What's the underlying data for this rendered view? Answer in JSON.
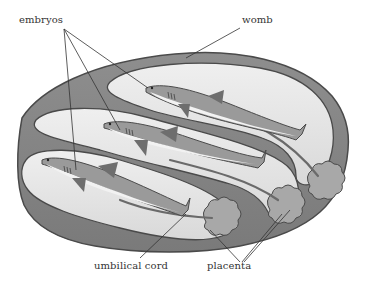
{
  "diagram": {
    "labels": {
      "embryos": "embryos",
      "womb": "womb",
      "umbilical_cord": "umbilical cord",
      "placenta": "placenta"
    },
    "embryo_count": 3,
    "placenta_count": 3,
    "colors": {
      "background": "#ffffff",
      "womb_wall": "#8a8a8a",
      "womb_wall_edge": "#4a4a4a",
      "chamber_fill": "#e6e6e6",
      "chamber_highlight": "#f4f4f4",
      "embryo_body": "#9a9a9a",
      "embryo_belly": "#f2f2f2",
      "embryo_fin": "#6e6e6e",
      "placenta": "#a8a8a8",
      "leader_line": "#333333",
      "label_text": "#333333"
    }
  }
}
